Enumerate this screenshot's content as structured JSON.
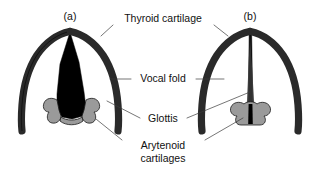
{
  "figure": {
    "kind": "anatomical-diagram",
    "background_color": "#ffffff",
    "width": 329,
    "height": 175
  },
  "panels": [
    {
      "id": "a",
      "caption": "(a)",
      "state": "abducted-open-glottis",
      "caption_x": 70,
      "caption_y": 20
    },
    {
      "id": "b",
      "caption": "(b)",
      "state": "adducted-closed-glottis",
      "caption_x": 250,
      "caption_y": 20
    }
  ],
  "labels": [
    {
      "id": "thyroid-cartilage",
      "text": "Thyroid cartilage",
      "lines": [
        "Thyroid cartilage"
      ],
      "x": 163,
      "y": 22
    },
    {
      "id": "vocal-fold",
      "text": "Vocal fold",
      "lines": [
        "Vocal fold"
      ],
      "x": 163,
      "y": 82
    },
    {
      "id": "glottis",
      "text": "Glottis",
      "lines": [
        "Glottis"
      ],
      "x": 163,
      "y": 122
    },
    {
      "id": "arytenoid-cartilages",
      "text": "Arytenoid cartilages",
      "lines": [
        "Arytenoid",
        "cartilages"
      ],
      "line1": "Arytenoid",
      "line2": "cartilages",
      "x": 163,
      "y": 149
    }
  ],
  "colors": {
    "cartilage_dark": "#2a2a2a",
    "glottis_black": "#000000",
    "arytenoid_gray": "#9a9a9a",
    "arytenoid_gray_light": "#b0b0b0",
    "leader_line": "#3b3b3b",
    "text": "#111111",
    "background": "#ffffff"
  }
}
